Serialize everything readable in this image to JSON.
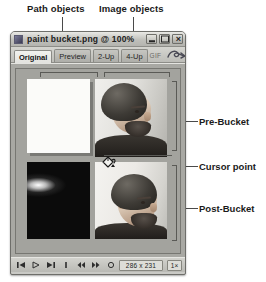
{
  "annotations": {
    "top": [
      {
        "label": "Path objects"
      },
      {
        "label": "Image objects"
      }
    ],
    "right": [
      {
        "label": "Pre-Bucket"
      },
      {
        "label": "Cursor point"
      },
      {
        "label": "Post-Bucket"
      }
    ]
  },
  "window": {
    "title": "paint bucket.png @ 100%",
    "app_icon": "document-icon",
    "controls": {
      "minimize": "minimize-icon",
      "maximize": "maximize-icon",
      "close": "close-icon",
      "close_glyph": "×"
    }
  },
  "tabs": [
    {
      "label": "Original",
      "active": true
    },
    {
      "label": "Preview",
      "active": false
    },
    {
      "label": "2-Up",
      "active": false
    },
    {
      "label": "4-Up",
      "active": false
    }
  ],
  "tabbar_right": {
    "format_label": "GIF",
    "preview_icon": "preview-in-browser-icon"
  },
  "canvas": {
    "quadrants": [
      {
        "name": "top-left",
        "content": "blank-white-path-object"
      },
      {
        "name": "top-right",
        "content": "portrait-photo-pre-bucket"
      },
      {
        "name": "bottom-left",
        "content": "dark-wave-gradient-path-object"
      },
      {
        "name": "bottom-right",
        "content": "portrait-photo-post-bucket"
      }
    ],
    "cursor": {
      "icon": "paint-bucket-cursor"
    }
  },
  "statusbar": {
    "buttons": [
      {
        "name": "first-frame-button",
        "icon": "skip-back-icon"
      },
      {
        "name": "play-button",
        "icon": "play-icon"
      },
      {
        "name": "last-frame-button",
        "icon": "skip-forward-icon"
      },
      {
        "name": "stop-button",
        "icon": "stop-icon"
      },
      {
        "name": "previous-frame-button",
        "icon": "step-back-icon"
      },
      {
        "name": "next-frame-button",
        "icon": "step-forward-icon"
      },
      {
        "name": "loop-button",
        "icon": "loop-icon"
      }
    ],
    "dimensions": "286 x 231",
    "zoom": "1×"
  },
  "colors": {
    "window_chrome": "#c9c9c5",
    "canvas_bg": "#a3a39e",
    "titlebar": "#c0c0bb",
    "border": "#6e6e6a",
    "annotation": "#4a4a4a"
  }
}
